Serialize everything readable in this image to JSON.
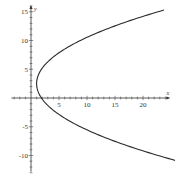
{
  "chart_data": {
    "type": "line",
    "title": "",
    "xlabel": "x",
    "ylabel": "y",
    "xlim": [
      -3.5,
      24
    ],
    "ylim": [
      -13,
      16
    ],
    "grid": false,
    "legend": null,
    "x_ticks": [
      5,
      10,
      15,
      20
    ],
    "x_tick_labels": [
      "5",
      "10",
      "15",
      "20"
    ],
    "y_ticks": [
      15,
      10,
      5,
      -5,
      -10
    ],
    "y_tick_labels": [
      "15",
      "10",
      "5",
      "-5",
      "-10"
    ],
    "minor_tick_step": 1,
    "series": [
      {
        "name": "parabola",
        "description": "Sideways parabola opening to the right, vertex near (1, 2.5)",
        "vertex": [
          1,
          2.5
        ],
        "points": [
          [
            24,
            15.3
          ],
          [
            20,
            14.1
          ],
          [
            15,
            12.4
          ],
          [
            10,
            10.5
          ],
          [
            7,
            9.1
          ],
          [
            5,
            7.9
          ],
          [
            3,
            6.3
          ],
          [
            2,
            5.2
          ],
          [
            1.3,
            4.0
          ],
          [
            1,
            2.5
          ],
          [
            1.3,
            1.0
          ],
          [
            2,
            -0.2
          ],
          [
            3,
            -1.3
          ],
          [
            5,
            -2.9
          ],
          [
            7,
            -4.1
          ],
          [
            10,
            -5.5
          ],
          [
            15,
            -7.4
          ],
          [
            20,
            -9.1
          ],
          [
            23.5,
            -10.9
          ]
        ]
      }
    ]
  },
  "axes": {
    "x_name": "x",
    "y_name": "y"
  }
}
